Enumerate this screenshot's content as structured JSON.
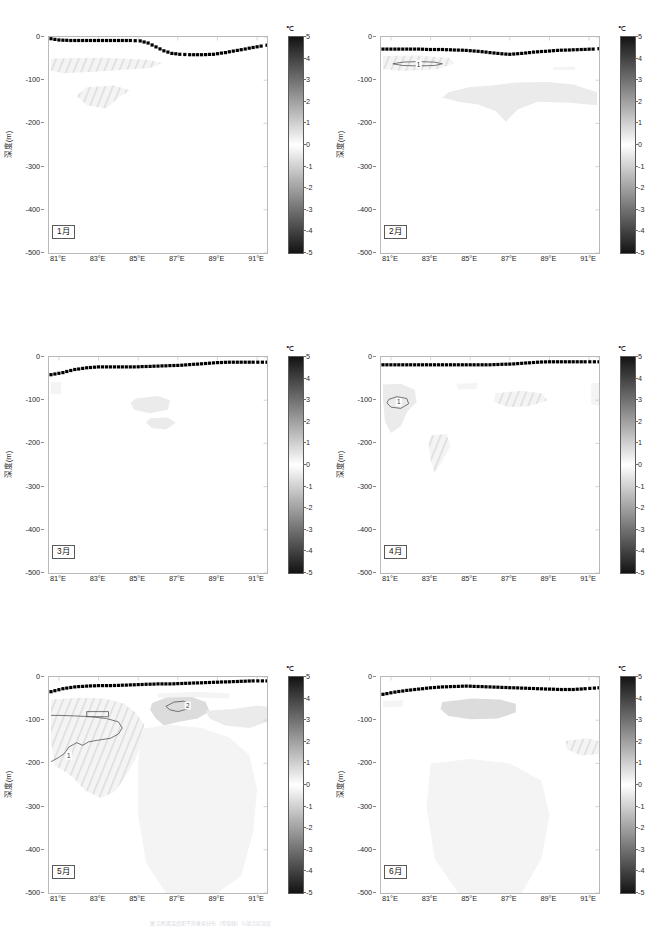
{
  "figure": {
    "type": "multi-panel-contour-section",
    "rows": 2,
    "cols": 3,
    "panel_count": 6,
    "caption": "图 沿断面温度距平的垂直分布（等值线）与混合层深度"
  },
  "axes": {
    "y_title": "深度(m)",
    "y_ticks": [
      0,
      -100,
      -200,
      -300,
      -400,
      -500
    ],
    "y_tick_labels": [
      "0",
      "-100",
      "-200",
      "-300",
      "-400",
      "-500"
    ],
    "y_min": -500,
    "y_max": 0,
    "x_ticks": [
      81,
      83,
      85,
      87,
      89,
      91
    ],
    "x_tick_labels": [
      "81°E",
      "83°E",
      "85°E",
      "87°E",
      "89°E",
      "91°E"
    ],
    "x_min": 80.5,
    "x_max": 91.5
  },
  "colorbar": {
    "unit": "℃",
    "min": -5,
    "max": 5,
    "ticks": [
      5,
      4,
      3,
      2,
      1,
      0,
      -1,
      -2,
      -3,
      -4,
      -5
    ],
    "tick_labels": [
      "5",
      "4",
      "3",
      "2",
      "1",
      "0",
      "-1",
      "-2",
      "-3",
      "-4",
      "-5"
    ],
    "colormap": "gray-diverging",
    "dark_color": "#1c1c1c",
    "mid_color": "#ffffff",
    "orientation": "vertical"
  },
  "style": {
    "mld_line_color": "#000000",
    "contour_color": "#555555",
    "frame_color": "#b9b9b9",
    "shade_light": "#ebebeb",
    "shade_mid": "#dcdcdc",
    "shade_faint": "#f4f4f4"
  },
  "chart_data": {
    "type": "line",
    "title": "",
    "xlabel": "",
    "ylabel": "深度(m)",
    "xlim": [
      80.5,
      91.5
    ],
    "ylim": [
      -500,
      0
    ],
    "grid": false,
    "legend": "none",
    "panels": [
      {
        "label": "1月",
        "month_index": 1,
        "mld_x": [
          80.6,
          81.0,
          81.6,
          82.2,
          82.8,
          83.4,
          84.0,
          84.6,
          85.1,
          85.5,
          85.9,
          86.3,
          86.7,
          87.1,
          87.6,
          88.2,
          88.8,
          89.4,
          90.0,
          90.6,
          91.2,
          91.5
        ],
        "mld_y": [
          -4,
          -7,
          -8,
          -8,
          -8,
          -8,
          -8,
          -8,
          -9,
          -14,
          -23,
          -32,
          -38,
          -40,
          -41,
          -41,
          -40,
          -36,
          -31,
          -26,
          -21,
          -19
        ],
        "contours": [],
        "contour_labels": [],
        "shaded_blobs": [
          "upper band 81-86E at -50 to -85 m (hatched, +1)",
          "patch 82.5-84.5E at -115 to -165 m (hatched, +1)"
        ]
      },
      {
        "label": "2月",
        "month_index": 2,
        "mld_x": [
          80.6,
          81.2,
          81.8,
          82.4,
          83.0,
          83.6,
          84.2,
          84.8,
          85.4,
          86.0,
          86.6,
          87.0,
          87.6,
          88.2,
          88.8,
          89.4,
          90.0,
          90.6,
          91.2,
          91.5
        ],
        "mld_y": [
          -28,
          -28,
          -28,
          -28,
          -29,
          -29,
          -30,
          -31,
          -33,
          -36,
          -39,
          -40,
          -38,
          -35,
          -33,
          -31,
          -30,
          -29,
          -28,
          -27
        ],
        "contours": [
          {
            "level": 1,
            "x_range": [
              81.0,
              83.6
            ],
            "y_range": [
              -55,
              -72
            ]
          }
        ],
        "contour_labels": [
          "1"
        ],
        "shaded_blobs": [
          "hatched band 80.8-84.2E at -45 to -78 m (+1)",
          "large patch 84-91E at -105 to -200 m (+1)",
          "small patch 89.3-90.2E at -72 m"
        ]
      },
      {
        "label": "3月",
        "month_index": 3,
        "mld_x": [
          80.6,
          81.2,
          81.8,
          82.4,
          83.0,
          83.6,
          84.2,
          84.8,
          85.4,
          86.0,
          86.6,
          87.2,
          87.8,
          88.4,
          89.0,
          89.6,
          90.2,
          90.8,
          91.5
        ],
        "mld_y": [
          -41,
          -36,
          -29,
          -25,
          -23,
          -23,
          -23,
          -23,
          -22,
          -21,
          -20,
          -19,
          -17,
          -15,
          -13,
          -12,
          -12,
          -12,
          -12
        ],
        "contours": [],
        "contour_labels": [],
        "shaded_blobs": [
          "patch 84.8-86.6E at -90 to -130 m (+1)",
          "patch 85.6-86.9E at -140 to -170 m (+1)",
          "sliver 80.6-81.1E at -60 to -85 m"
        ]
      },
      {
        "label": "4月",
        "month_index": 4,
        "mld_x": [
          80.6,
          81.2,
          81.8,
          82.4,
          83.0,
          83.6,
          84.2,
          84.8,
          85.4,
          86.0,
          86.6,
          87.2,
          87.8,
          88.4,
          89.0,
          89.6,
          90.2,
          90.8,
          91.5
        ],
        "mld_y": [
          -18,
          -18,
          -18,
          -18,
          -18,
          -18,
          -18,
          -18,
          -18,
          -18,
          -17,
          -16,
          -14,
          -12,
          -11,
          -11,
          -11,
          -11,
          -11
        ],
        "contours": [
          {
            "level": 1,
            "x_range": [
              80.8,
              81.9
            ],
            "y_range": [
              -92,
              -120
            ]
          }
        ],
        "contour_labels": [
          "1"
        ],
        "shaded_blobs": [
          "blob 80.6-82.3E at -65 to -175 m (+1, with contour)",
          "hatched band 86.3-89.0E at -80 to -115 m (+1)",
          "narrow streak 83.0-84.0E at -180 to -270 m (+1)",
          "faint patch 84.3-85.4E at -60 to -75 m",
          "edge sliver at 91.3E -60 to -110 m"
        ]
      },
      {
        "label": "5月",
        "month_index": 5,
        "mld_x": [
          80.6,
          81.2,
          81.8,
          82.4,
          83.0,
          83.6,
          84.2,
          84.8,
          85.4,
          86.0,
          86.6,
          87.2,
          87.8,
          88.4,
          89.0,
          89.6,
          90.2,
          90.8,
          91.5
        ],
        "mld_y": [
          -34,
          -27,
          -23,
          -21,
          -20,
          -20,
          -19,
          -18,
          -17,
          -16,
          -16,
          -15,
          -14,
          -13,
          -12,
          -11,
          -10,
          -9,
          -9
        ],
        "contours": [
          {
            "level": 1,
            "x_range": [
              80.6,
              84.3
            ],
            "y_range": [
              -88,
              -200
            ]
          },
          {
            "level": 2,
            "x_range": [
              86.3,
              87.4
            ],
            "y_range": [
              -55,
              -80
            ]
          },
          {
            "level": 1,
            "x_range": [
              82.4,
              83.5
            ],
            "y_range": [
              -78,
              -92
            ]
          }
        ],
        "contour_labels": [
          "1",
          "2"
        ],
        "shaded_blobs": [
          "large hatched mass 80.6-85.3E at -50 to -280 m (+1 to +2)",
          "mid patch 85.8-88.6E at -45 to -130 m (+1 to +2)",
          "broad faint field 85-91.5E down to -500 m",
          "right edge band 90.5-91.5E at -60 to -140 m"
        ]
      },
      {
        "label": "6月",
        "month_index": 6,
        "mld_x": [
          80.6,
          81.2,
          81.8,
          82.4,
          83.0,
          83.6,
          84.2,
          84.8,
          85.4,
          86.0,
          86.6,
          87.2,
          87.8,
          88.4,
          89.0,
          89.6,
          90.2,
          90.8,
          91.5
        ],
        "mld_y": [
          -40,
          -35,
          -31,
          -28,
          -25,
          -23,
          -22,
          -21,
          -22,
          -23,
          -24,
          -25,
          -26,
          -27,
          -28,
          -29,
          -29,
          -27,
          -25
        ],
        "contours": [],
        "contour_labels": [],
        "shaded_blobs": [
          "patch 83.6-87.3E at -55 to -98 m (+1)",
          "sliver 80.6-81.6E at -55 to -70 m",
          "hatched patch 89.8-91.3E at -145 to -180 m (+1)",
          "broad faint field 83-89E down to -500 m"
        ]
      }
    ]
  }
}
